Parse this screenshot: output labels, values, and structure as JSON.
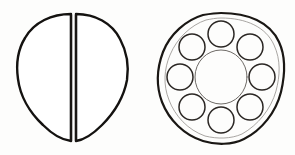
{
  "figure": {
    "medium": "pen-and-ink line drawing",
    "background_color": "#fdfdfc",
    "ink_color": "#1a1714",
    "canvas": {
      "width": 295,
      "height": 155
    }
  },
  "objects": [
    {
      "id": "split-disc",
      "data_name": "split-disc-figure",
      "label": "Split disc",
      "description": "Circular disc divided into two equal halves by a vertical cleft",
      "outline_style": "heavy-ink",
      "center": {
        "x": 73,
        "y": 77
      },
      "radius_x": 55,
      "radius_y": 64,
      "gap_width": 4,
      "gap_axis": "vertical",
      "halves": [
        {
          "data_name": "split-disc-half-left",
          "side": "left"
        },
        {
          "data_name": "split-disc-half-right",
          "side": "right"
        }
      ]
    },
    {
      "id": "perforated-disc",
      "data_name": "perforated-disc-figure",
      "label": "Perforated disc",
      "description": "Circular disc with a central bore encircled by eight evenly spaced perforations",
      "outline_style": "heavy-ink",
      "center": {
        "x": 221,
        "y": 77
      },
      "radius_x": 62,
      "radius_y": 65,
      "inner_bore": {
        "data_name": "central-bore",
        "label": "Central bore",
        "center": {
          "x": 221,
          "y": 77
        },
        "radius_x": 26,
        "radius_y": 27,
        "outline_style": "light-ink"
      },
      "perforation_ring": {
        "data_name": "perforation-ring",
        "label": "Perforation ring",
        "count": 8,
        "ring_radius_x": 41,
        "ring_radius_y": 43,
        "hole_radius": 13,
        "start_angle_deg": -90,
        "outline_style": "medium-ink",
        "holes": [
          {
            "data_name": "perforation-1",
            "index": 1,
            "angle_deg": -90,
            "cx": 221,
            "cy": 34
          },
          {
            "data_name": "perforation-2",
            "index": 2,
            "angle_deg": -45,
            "cx": 250,
            "cy": 47
          },
          {
            "data_name": "perforation-3",
            "index": 3,
            "angle_deg": 0,
            "cx": 262,
            "cy": 77
          },
          {
            "data_name": "perforation-4",
            "index": 4,
            "angle_deg": 45,
            "cx": 250,
            "cy": 107
          },
          {
            "data_name": "perforation-5",
            "index": 5,
            "angle_deg": 90,
            "cx": 221,
            "cy": 120
          },
          {
            "data_name": "perforation-6",
            "index": 6,
            "angle_deg": 135,
            "cx": 192,
            "cy": 107
          },
          {
            "data_name": "perforation-7",
            "index": 7,
            "angle_deg": 180,
            "cx": 180,
            "cy": 77
          },
          {
            "data_name": "perforation-8",
            "index": 8,
            "angle_deg": -135,
            "cx": 192,
            "cy": 47
          }
        ]
      }
    }
  ],
  "captions": {
    "visible": false,
    "items": []
  }
}
